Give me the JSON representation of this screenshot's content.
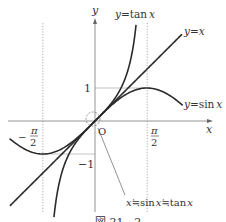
{
  "figure": {
    "origin_px": [
      95,
      121
    ],
    "unit_px": [
      33.1,
      33
    ],
    "colors": {
      "curve": "#2b2b2b",
      "axis": "#888888",
      "text": "#333333"
    },
    "axes": {
      "x_label": "x",
      "y_label": "y",
      "origin_label": "O"
    },
    "ticks": {
      "y_one": "1",
      "y_neg_one": "−1",
      "x_pi_half_num": "π",
      "x_pi_half_den": "2",
      "x_neg_sign": "−"
    },
    "curves": [
      {
        "name": "y=tan x",
        "label_y": "y",
        "label_eq": "=",
        "label_fn": "tan",
        "label_var": "x",
        "domain": [
          -1.24,
          1.24
        ]
      },
      {
        "name": "y=x",
        "label_y": "y",
        "label_eq": "=",
        "label_var": "x",
        "domain": [
          -2.57,
          2.63
        ]
      },
      {
        "name": "y=sin x",
        "label_y": "y",
        "label_eq": "=",
        "label_fn": "sin",
        "label_var": "x",
        "domain": [
          -2.58,
          2.65
        ]
      }
    ],
    "annotation": {
      "text_a": "x",
      "approx1": "≒",
      "text_b": "sin",
      "text_c": "x",
      "approx2": "≒",
      "text_d": "tan",
      "text_e": "x"
    },
    "caption": "図 21 - 2"
  }
}
